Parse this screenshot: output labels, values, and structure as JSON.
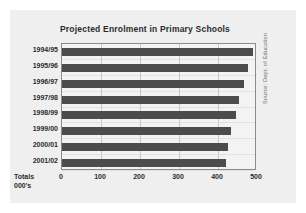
{
  "chart_data": {
    "type": "bar",
    "orientation": "horizontal",
    "title": "Projected Enrolment in Primary Schools",
    "categories": [
      "1994/95",
      "1995/96",
      "1996/97",
      "1997/98",
      "1998/99",
      "1999/00",
      "2000/01",
      "2001/02"
    ],
    "values": [
      490,
      478,
      466,
      455,
      445,
      434,
      425,
      420
    ],
    "xlabel": "Totals 000's",
    "ylabel": "",
    "xlim": [
      0,
      500
    ],
    "xticks": [
      0,
      100,
      200,
      300,
      400,
      500
    ],
    "xtick_labels": [
      "0",
      "100",
      "200",
      "300",
      "400",
      "500"
    ],
    "grid": true,
    "legend": false,
    "annotations": [
      "Source: Dept. of Education"
    ],
    "bar_color": "#4c4c4c",
    "plot_background": "#f3f3f3",
    "card_background": "#efefef"
  },
  "axis_caption": {
    "line1": "Totals",
    "line2": "000's"
  },
  "source": {
    "text": "Source: Dept. of Education"
  }
}
